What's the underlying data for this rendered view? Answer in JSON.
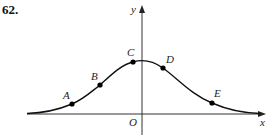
{
  "problem_number": "62.",
  "axes": {
    "x_label": "x",
    "y_label": "y",
    "origin_label": "O"
  },
  "curve": {
    "description": "bell-shaped curve symmetric-ish about y-axis, peak slightly right of y-axis",
    "color": "#111111"
  },
  "points": [
    {
      "label": "A",
      "cx": 72,
      "cy": 104,
      "lx": 63,
      "ly": 99
    },
    {
      "label": "B",
      "cx": 100,
      "cy": 85,
      "lx": 91,
      "ly": 80
    },
    {
      "label": "C",
      "cx": 133,
      "cy": 62,
      "lx": 127,
      "ly": 57
    },
    {
      "label": "D",
      "cx": 163,
      "cy": 68,
      "lx": 167,
      "ly": 63
    },
    {
      "label": "E",
      "cx": 212,
      "cy": 103,
      "lx": 215,
      "ly": 97
    }
  ]
}
